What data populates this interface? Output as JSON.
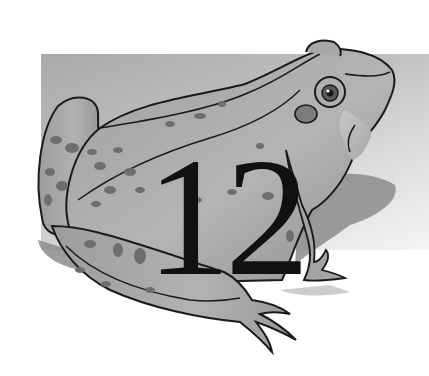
{
  "illustration": {
    "subject": "frog",
    "style": "grayscale hand-drawn illustration",
    "chapter_number": "12",
    "icons": {
      "frog": "frog-illustration",
      "backdrop": "gradient-rectangle"
    },
    "colors": {
      "backdrop_dark": "#a9a9a9",
      "backdrop_light": "#f4f4f4",
      "frog_body": "#9a9a9a",
      "frog_light": "#bcbcbc",
      "frog_spots": "#6e6e6e",
      "outline": "#1a1a1a",
      "shadow": "#8c8c8c",
      "numeral": "#111111"
    }
  }
}
